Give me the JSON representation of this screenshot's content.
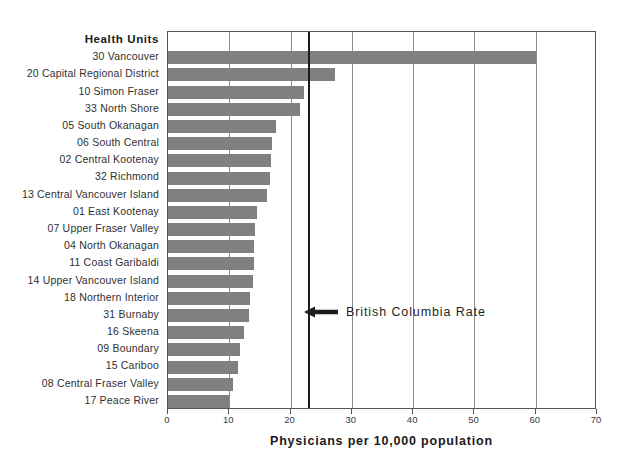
{
  "chart_data": {
    "type": "bar",
    "orientation": "horizontal",
    "title": "",
    "category_axis_header": "Health Units",
    "xlabel": "Physicians per 10,000 population",
    "ylabel": "",
    "xlim": [
      0,
      70
    ],
    "xticks": [
      0,
      10,
      20,
      30,
      40,
      50,
      60,
      70
    ],
    "xticklabels": [
      "0",
      "10",
      "20",
      "30",
      "40",
      "50",
      "60",
      "70"
    ],
    "grid": "vertical",
    "legend": "none",
    "bar_color": "#808080",
    "axis_color": "#555555",
    "gridline_color": "#8c8c8c",
    "categories": [
      "30 Vancouver",
      "20 Capital Regional District",
      "10 Simon Fraser",
      "33 North Shore",
      "05 South Okanagan",
      "06 South Central",
      "02 Central Kootenay",
      "32 Richmond",
      "13 Central Vancouver Island",
      "01 East Kootenay",
      "07 Upper Fraser Valley",
      "04 North Okanagan",
      "11 Coast Garibaldi",
      "14 Upper Vancouver Island",
      "18 Northern Interior",
      "31 Burnaby",
      "16 Skeena",
      "09 Boundary",
      "15 Cariboo",
      "08 Central Fraser Valley",
      "17 Peace River"
    ],
    "values": [
      60.0,
      27.3,
      22.2,
      21.5,
      17.6,
      17.0,
      16.8,
      16.7,
      16.2,
      14.6,
      14.2,
      14.1,
      14.0,
      13.9,
      13.4,
      13.2,
      12.4,
      11.7,
      11.5,
      10.6,
      10.0
    ],
    "annotations": [
      {
        "label": "British Columbia Rate",
        "value": 22.8,
        "marker": "arrow-left",
        "line_color": "#1c1c1c"
      }
    ]
  }
}
